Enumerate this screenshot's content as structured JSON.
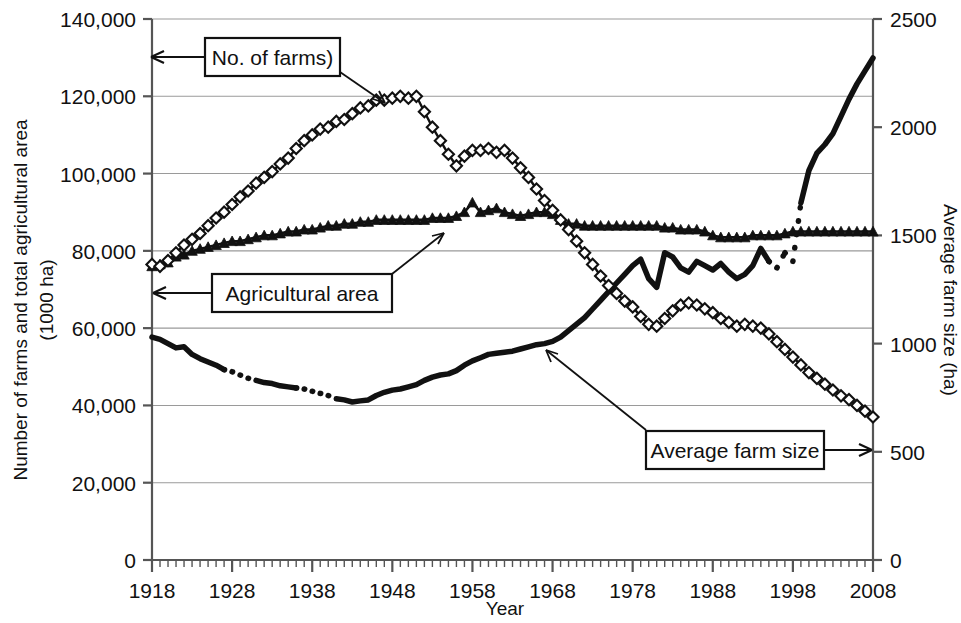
{
  "figure": {
    "background": "#ffffff",
    "ink": "#111111",
    "gridline_color": "#9a9a9a"
  },
  "axes": {
    "left": {
      "title_line1": "Number of farms and total agricultural area",
      "title_line2": "(1000 ha)",
      "ticks": [
        "0",
        "20,000",
        "40,000",
        "60,000",
        "80,000",
        "100,000",
        "120,000",
        "140,000"
      ],
      "min": 0,
      "max": 140000,
      "step": 20000
    },
    "right": {
      "title": "Average farm size (ha)",
      "ticks": [
        "0",
        "500",
        "1000",
        "1500",
        "2000",
        "2500"
      ],
      "min": 0,
      "max": 2500,
      "step": 500
    },
    "bottom": {
      "title": "Year",
      "ticks": [
        "1918",
        "1928",
        "1938",
        "1948",
        "1958",
        "1968",
        "1978",
        "1988",
        "1998",
        "2008"
      ],
      "min": 1918,
      "max": 2008,
      "step": 10,
      "minor_step": 1
    }
  },
  "callouts": [
    {
      "name": "no-of-farms",
      "label": "No. of farms)"
    },
    {
      "name": "agricultural-area",
      "label": "Agricultural area"
    },
    {
      "name": "average-farm-size",
      "label": "Average farm size"
    }
  ],
  "chart_data": {
    "type": "line",
    "title": "",
    "xlabel": "Year",
    "ylabel": "Number of farms and total agricultural area (1000 ha)",
    "ylabel_secondary": "Average farm size (ha)",
    "xlim": [
      1918,
      2008
    ],
    "ylim": [
      0,
      140000
    ],
    "ylim_secondary": [
      0,
      2500
    ],
    "grid": true,
    "legend_position": "inline-callouts",
    "series": [
      {
        "name": "No. of farms)",
        "axis": "left",
        "marker": "open-diamond",
        "line": "solid",
        "x": [
          1918,
          1919,
          1920,
          1921,
          1922,
          1923,
          1924,
          1925,
          1926,
          1927,
          1928,
          1929,
          1930,
          1931,
          1932,
          1933,
          1934,
          1935,
          1936,
          1937,
          1938,
          1939,
          1940,
          1941,
          1942,
          1943,
          1944,
          1945,
          1946,
          1947,
          1948,
          1949,
          1950,
          1951,
          1952,
          1953,
          1954,
          1955,
          1956,
          1957,
          1958,
          1959,
          1960,
          1961,
          1962,
          1963,
          1964,
          1965,
          1966,
          1967,
          1968,
          1969,
          1970,
          1971,
          1972,
          1973,
          1974,
          1975,
          1976,
          1977,
          1978,
          1979,
          1980,
          1981,
          1982,
          1983,
          1984,
          1985,
          1986,
          1987,
          1988,
          1989,
          1990,
          1991,
          1992,
          1993,
          1994,
          1995,
          1996,
          1997,
          1998,
          1999,
          2000,
          2001,
          2002,
          2003,
          2004,
          2005,
          2006,
          2007,
          2008
        ],
        "y": [
          76500,
          76000,
          77500,
          79500,
          81500,
          83000,
          84500,
          86500,
          88500,
          90000,
          92000,
          94000,
          95500,
          97500,
          99000,
          100500,
          102500,
          104000,
          106500,
          108500,
          110000,
          111500,
          112000,
          113500,
          114000,
          115500,
          117000,
          117500,
          119000,
          119000,
          119500,
          120000,
          119500,
          120000,
          116000,
          112000,
          108500,
          105000,
          102000,
          104500,
          106000,
          106000,
          106500,
          105500,
          106000,
          104000,
          101500,
          99000,
          96000,
          93000,
          90500,
          88000,
          85500,
          82500,
          79500,
          76500,
          73500,
          71000,
          69000,
          67000,
          65500,
          63000,
          61000,
          60500,
          62500,
          64500,
          66000,
          66500,
          66000,
          65000,
          64000,
          62500,
          61500,
          60500,
          61000,
          60500,
          60000,
          58500,
          56500,
          54500,
          52500,
          50500,
          48500,
          47000,
          45500,
          44000,
          42500,
          41500,
          40000,
          38500,
          37000
        ]
      },
      {
        "name": "Agricultural area",
        "axis": "left",
        "marker": "filled-triangle",
        "line": "solid",
        "x": [
          1918,
          1919,
          1920,
          1921,
          1922,
          1923,
          1924,
          1925,
          1926,
          1927,
          1928,
          1929,
          1930,
          1931,
          1932,
          1933,
          1934,
          1935,
          1936,
          1937,
          1938,
          1939,
          1940,
          1941,
          1942,
          1943,
          1944,
          1945,
          1946,
          1947,
          1948,
          1949,
          1950,
          1951,
          1952,
          1953,
          1954,
          1955,
          1956,
          1957,
          1958,
          1959,
          1960,
          1961,
          1962,
          1963,
          1964,
          1965,
          1966,
          1967,
          1968,
          1969,
          1970,
          1971,
          1972,
          1973,
          1974,
          1975,
          1976,
          1977,
          1978,
          1979,
          1980,
          1981,
          1982,
          1983,
          1984,
          1985,
          1986,
          1987,
          1988,
          1989,
          1990,
          1991,
          1992,
          1993,
          1994,
          1995,
          1996,
          1997,
          1998,
          1999,
          2000,
          2001,
          2002,
          2003,
          2004,
          2005,
          2006,
          2007,
          2008
        ],
        "y": [
          76000,
          76500,
          77000,
          78500,
          79000,
          80000,
          80500,
          81000,
          81500,
          82000,
          82500,
          82500,
          83000,
          83500,
          84000,
          84000,
          84500,
          85000,
          85000,
          85500,
          85500,
          86000,
          86500,
          86500,
          87000,
          87000,
          87500,
          87500,
          88000,
          88000,
          88000,
          88000,
          88000,
          88000,
          88000,
          88500,
          88500,
          88500,
          89000,
          90000,
          92500,
          90000,
          90500,
          91000,
          90000,
          89500,
          89000,
          89500,
          90000,
          90000,
          89500,
          88000,
          87000,
          87000,
          86500,
          86500,
          86500,
          86500,
          86500,
          86500,
          86500,
          86500,
          86500,
          86500,
          86000,
          86000,
          85500,
          85500,
          85500,
          85000,
          84000,
          83500,
          83500,
          83500,
          83500,
          84000,
          84000,
          84000,
          84000,
          84500,
          85000,
          85000,
          85000,
          85000,
          85000,
          85000,
          85000,
          85000,
          85000,
          85000,
          85000
        ]
      },
      {
        "name": "Average farm size",
        "axis": "right",
        "marker": "none",
        "line": "solid-with-dotted-gaps",
        "gaps": [
          [
            1927,
            1931
          ],
          [
            1936,
            1941
          ],
          [
            1995,
            1999
          ]
        ],
        "x": [
          1918,
          1919,
          1920,
          1921,
          1922,
          1923,
          1924,
          1925,
          1926,
          1927,
          1928,
          1929,
          1930,
          1931,
          1932,
          1933,
          1934,
          1935,
          1936,
          1937,
          1938,
          1939,
          1940,
          1941,
          1942,
          1943,
          1944,
          1945,
          1946,
          1947,
          1948,
          1949,
          1950,
          1951,
          1952,
          1953,
          1954,
          1955,
          1956,
          1957,
          1958,
          1959,
          1960,
          1961,
          1962,
          1963,
          1964,
          1965,
          1966,
          1967,
          1968,
          1969,
          1970,
          1971,
          1972,
          1973,
          1974,
          1975,
          1976,
          1977,
          1978,
          1979,
          1980,
          1981,
          1982,
          1983,
          1984,
          1985,
          1986,
          1987,
          1988,
          1989,
          1990,
          1991,
          1992,
          1993,
          1994,
          1995,
          1996,
          1997,
          1998,
          1999,
          2000,
          2001,
          2002,
          2003,
          2004,
          2005,
          2006,
          2007,
          2008
        ],
        "y": [
          1030,
          1020,
          1000,
          980,
          985,
          950,
          930,
          915,
          900,
          880,
          870,
          855,
          840,
          830,
          820,
          815,
          805,
          800,
          795,
          790,
          780,
          770,
          760,
          745,
          740,
          730,
          735,
          740,
          760,
          775,
          785,
          790,
          800,
          810,
          830,
          845,
          855,
          860,
          875,
          900,
          920,
          935,
          950,
          955,
          960,
          965,
          975,
          985,
          995,
          1000,
          1010,
          1030,
          1060,
          1090,
          1120,
          1160,
          1200,
          1240,
          1280,
          1320,
          1360,
          1390,
          1300,
          1260,
          1420,
          1400,
          1350,
          1330,
          1380,
          1360,
          1340,
          1370,
          1330,
          1300,
          1320,
          1360,
          1440,
          1380,
          1350,
          1420,
          1380,
          1650,
          1800,
          1880,
          1920,
          1970,
          2050,
          2130,
          2200,
          2260,
          2320
        ]
      }
    ]
  }
}
